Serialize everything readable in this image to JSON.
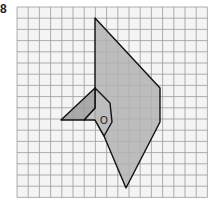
{
  "figure": {
    "label": "8",
    "center_label": "O",
    "grid": {
      "x0": 17,
      "y0": 7,
      "cols": 17,
      "rows": 17,
      "cell": 11.2,
      "line_color": "#9a9a9a",
      "bg_color": "#f4f4f4"
    },
    "colors": {
      "large_shape_fill": "#b3b3b3",
      "small_triangle_fill": "#9c9c9c",
      "inner_shape_fill": "#bdbdbd",
      "stroke": "#111111"
    },
    "shapes": {
      "large": "95,18 160,88 160,122 126,188 104,136 95,120 95,88",
      "small_triangle": "95,88 61,120 84,120 95,108",
      "inner": "95,88 110,103 112,122 104,136 95,120 84,120 95,108"
    },
    "center_point": {
      "x": 104,
      "y": 120
    }
  }
}
